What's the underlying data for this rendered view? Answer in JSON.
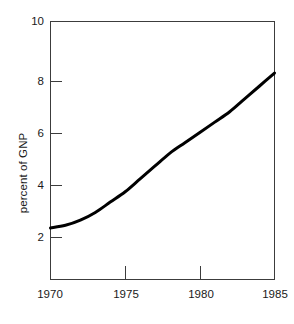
{
  "chart_data": {
    "type": "line",
    "title": "",
    "subtitle": "",
    "xlabel": "",
    "ylabel": "percent of GNP",
    "xlim": [
      1970,
      1985
    ],
    "ylim": [
      0,
      10
    ],
    "grid": false,
    "legend": false,
    "legend_position": "none",
    "x_ticks": [
      1970,
      1975,
      1980,
      1985
    ],
    "x_tick_labels": [
      "1970",
      "1975",
      "1980",
      "1985"
    ],
    "y_ticks": [
      2,
      4,
      6,
      8,
      10
    ],
    "y_tick_labels": [
      "2",
      "4",
      "6",
      "8",
      "10"
    ],
    "series": [
      {
        "name": "percent of GNP",
        "color": "#000000",
        "line_width": 3,
        "x": [
          1970,
          1971,
          1972,
          1973,
          1974,
          1975,
          1976,
          1977,
          1978,
          1979,
          1980,
          1981,
          1982,
          1983,
          1984,
          1985
        ],
        "values": [
          2.0,
          2.1,
          2.3,
          2.6,
          3.0,
          3.4,
          3.9,
          4.4,
          4.9,
          5.3,
          5.7,
          6.1,
          6.5,
          7.0,
          7.5,
          8.0
        ]
      }
    ],
    "annotations": []
  },
  "axes": {
    "frame_color": "#3c3c3c",
    "background": "#ffffff",
    "y_axis_title": "percent of GNP"
  }
}
